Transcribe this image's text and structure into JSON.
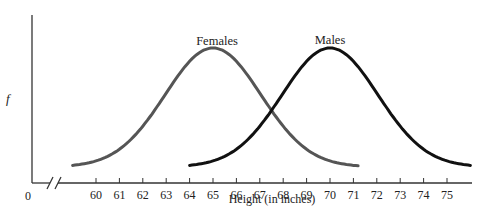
{
  "chart_data": {
    "type": "line",
    "title": "",
    "xlabel": "Height (in inches)",
    "ylabel": "f",
    "origin_label": "0",
    "x_ticks": [
      60,
      61,
      62,
      63,
      64,
      65,
      66,
      67,
      68,
      69,
      70,
      71,
      72,
      73,
      74,
      75
    ],
    "x_range": [
      59,
      76
    ],
    "axis_break": true,
    "grid": false,
    "legend": "inline labels above peaks",
    "series": [
      {
        "name": "Females",
        "mean": 65,
        "x_start": 59,
        "x_end": 71.2,
        "color": "#555555",
        "distribution": "normal"
      },
      {
        "name": "Males",
        "mean": 70,
        "x_start": 64,
        "x_end": 76,
        "color": "#111111",
        "distribution": "normal"
      }
    ]
  }
}
